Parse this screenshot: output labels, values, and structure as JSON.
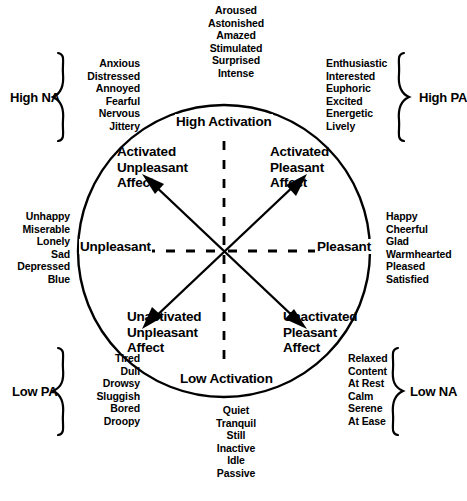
{
  "figure": {
    "type": "circumplex-model-of-affect-diagram",
    "axes": {
      "vertical_top": "High Activation",
      "vertical_bottom": "Low Activation",
      "horizontal_left": "Unpleasant",
      "horizontal_right": "Pleasant"
    },
    "quadrants": [
      {
        "id": "activated-unpleasant",
        "lines": [
          "Activated",
          "Unpleasant",
          "Affect"
        ]
      },
      {
        "id": "activated-pleasant",
        "lines": [
          "Activated",
          "Pleasant",
          "Affect"
        ]
      },
      {
        "id": "unactivated-unpleasant",
        "lines": [
          "Unactivated",
          "Unpleasant",
          "Affect"
        ]
      },
      {
        "id": "unactivated-pleasant",
        "lines": [
          "Unactivated",
          "Pleasant",
          "Affect"
        ]
      }
    ],
    "descriptor_lists": {
      "high_activation": [
        "Aroused",
        "Astonished",
        "Amazed",
        "Stimulated",
        "Surprised",
        "Intense"
      ],
      "low_activation": [
        "Quiet",
        "Tranquil",
        "Still",
        "Inactive",
        "Idle",
        "Passive"
      ],
      "high_na": [
        "Anxious",
        "Distressed",
        "Annoyed",
        "Fearful",
        "Nervous",
        "Jittery"
      ],
      "high_pa": [
        "Enthusiastic",
        "Interested",
        "Euphoric",
        "Excited",
        "Energetic",
        "Lively"
      ],
      "low_pa": [
        "Tired",
        "Dull",
        "Drowsy",
        "Sluggish",
        "Bored",
        "Droopy"
      ],
      "low_na": [
        "Relaxed",
        "Content",
        "At Rest",
        "Calm",
        "Serene",
        "At Ease"
      ],
      "unpleasant": [
        "Unhappy",
        "Miserable",
        "Lonely",
        "Sad",
        "Depressed",
        "Blue"
      ],
      "pleasant": [
        "Happy",
        "Cheerful",
        "Glad",
        "Warmhearted",
        "Pleased",
        "Satisfied"
      ]
    },
    "brace_labels": {
      "high_na": "High NA",
      "high_pa": "High PA",
      "low_pa": "Low PA",
      "low_na": "Low NA"
    },
    "colors": {
      "ink": "#000000",
      "background": "#ffffff"
    }
  }
}
